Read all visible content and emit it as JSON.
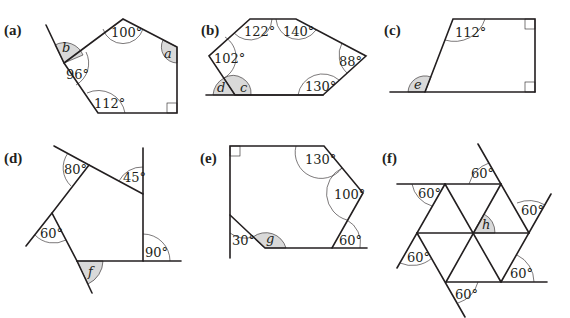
{
  "diagrams": {
    "a": {
      "label": "(a)",
      "angles": [
        "100°",
        "96°",
        "112°"
      ],
      "unknowns": [
        "a",
        "b"
      ]
    },
    "b": {
      "label": "(b)",
      "angles": [
        "122°",
        "140°",
        "102°",
        "88°",
        "130°"
      ],
      "unknowns": [
        "c",
        "d"
      ]
    },
    "c": {
      "label": "(c)",
      "angles": [
        "112°"
      ],
      "unknowns": [
        "e"
      ]
    },
    "d": {
      "label": "(d)",
      "angles": [
        "80°",
        "45°",
        "60°",
        "90°"
      ],
      "unknowns": [
        "f"
      ]
    },
    "e": {
      "label": "(e)",
      "angles": [
        "130°",
        "100°",
        "30°",
        "60°"
      ],
      "unknowns": [
        "g"
      ]
    },
    "f": {
      "label": "(f)",
      "angles": [
        "60°",
        "60°",
        "60°",
        "60°",
        "60°",
        "60°"
      ],
      "unknowns": [
        "h"
      ]
    }
  },
  "colors": {
    "line": "#231f20",
    "shading": "#d9d9d9",
    "background": "#ffffff"
  }
}
